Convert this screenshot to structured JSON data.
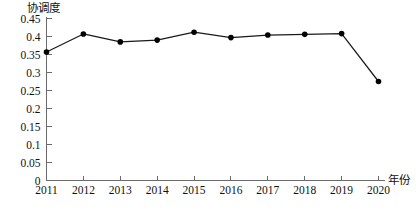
{
  "chart_data": {
    "type": "line",
    "title": "",
    "xlabel": "年份",
    "ylabel": "协调度",
    "x": [
      2011,
      2012,
      2013,
      2014,
      2015,
      2016,
      2017,
      2018,
      2019,
      2020
    ],
    "categories": [
      "2011",
      "2012",
      "2013",
      "2014",
      "2015",
      "2016",
      "2017",
      "2018",
      "2019",
      "2020"
    ],
    "values": [
      0.357,
      0.407,
      0.385,
      0.39,
      0.412,
      0.397,
      0.404,
      0.406,
      0.408,
      0.275
    ],
    "series": [
      {
        "name": "协调度",
        "values": [
          0.357,
          0.407,
          0.385,
          0.39,
          0.412,
          0.397,
          0.404,
          0.406,
          0.408,
          0.275
        ]
      }
    ],
    "ylim": [
      0,
      0.45
    ],
    "xlim": [
      2011,
      2020
    ],
    "y_ticks": [
      0,
      0.05,
      0.1,
      0.15,
      0.2,
      0.25,
      0.3,
      0.35,
      0.4,
      0.45
    ],
    "y_tick_labels": [
      "0",
      "0.05",
      "0.1",
      "0.15",
      "0.2",
      "0.25",
      "0.3",
      "0.35",
      "0.4",
      "0.45"
    ],
    "x_ticks": [
      2011,
      2012,
      2013,
      2014,
      2015,
      2016,
      2017,
      2018,
      2019,
      2020
    ],
    "x_tick_labels": [
      "2011",
      "2012",
      "2013",
      "2014",
      "2015",
      "2016",
      "2017",
      "2018",
      "2019",
      "2020"
    ],
    "grid": false,
    "legend": false,
    "legend_position": "none",
    "marker": "circle",
    "line_color": "#1a1a1a",
    "marker_color": "#000000",
    "axis_color": "#6b6b6b",
    "background_color": "#ffffff"
  }
}
